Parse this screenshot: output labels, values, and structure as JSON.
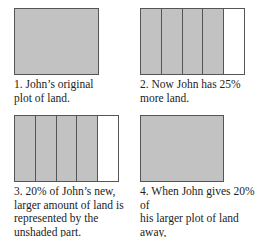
{
  "panels": [
    {
      "caption": "1. John’s original\nplot of land.",
      "columns": 0,
      "shaded_columns": 0
    },
    {
      "caption": "2. Now John has 25%\nmore land.",
      "columns": 5,
      "shaded_columns": 4
    },
    {
      "caption": "3. 20% of John’s new,\nlarger amount of land is\nrepresented by the\nunshaded part.",
      "columns": 5,
      "shaded_columns": 4
    },
    {
      "caption": "4. When John gives 20% of\nhis larger plot of land away,\nhe’s left with the amount\nhe started with.",
      "columns": 0,
      "shaded_columns": 0
    }
  ],
  "colors": {
    "shaded": "#c2c2c2",
    "unshaded": "#ffffff",
    "border": "#555555"
  }
}
